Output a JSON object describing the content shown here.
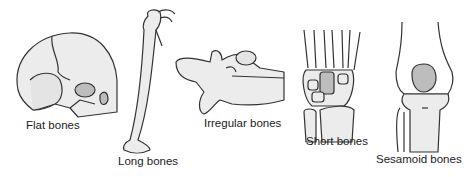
{
  "diagram": {
    "labels": {
      "flat": "Flat bones",
      "long": "Long bones",
      "irregular": "Irregular bones",
      "short": "Short bones",
      "sesamoid": "Sesamoid bones"
    },
    "colors": {
      "bone_fill": "#ececec",
      "shade_fill": "#bdbdbd",
      "outline": "#333333"
    }
  }
}
